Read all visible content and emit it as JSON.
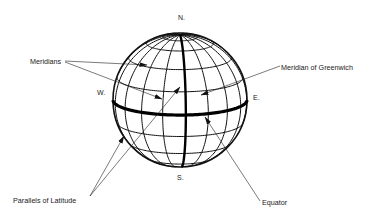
{
  "figure": {
    "type": "globe-graticule-diagram",
    "cardinal_directions": {
      "north": "N.",
      "south": "S.",
      "west": "W.",
      "east": "E."
    },
    "labels": {
      "meridians": "Meridians",
      "meridian_of_greenwich": "Meridian of Greenwich",
      "parallels_of_latitude": "Parallels of Latitude",
      "equator": "Equator"
    },
    "graticule": {
      "meridian_spacing_deg": 20,
      "parallels_deg": [
        -60,
        -40,
        -20,
        20,
        40,
        60,
        75
      ],
      "highlighted": [
        "equator",
        "prime-meridian"
      ]
    },
    "colors": {
      "ink": "#111111",
      "background": "#ffffff"
    }
  }
}
